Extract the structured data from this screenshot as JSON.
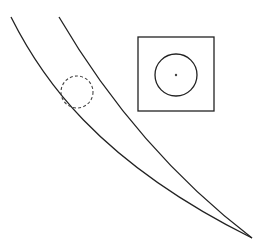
{
  "diagram": {
    "stroke_color": "#222222",
    "background": "#ffffff",
    "band": {
      "left_curve": "M 11 17 C 40 75, 95 160, 252 238",
      "right_curve": "M 59 17 C 90 70, 150 160, 252 238"
    },
    "dashed_circle": {
      "cx": 77,
      "cy": 92,
      "r": 16
    },
    "inset_box": {
      "x": 138,
      "y": 37,
      "width": 76,
      "height": 74
    },
    "inset_circle": {
      "cx": 176,
      "cy": 75,
      "r": 21
    },
    "inset_dot": {
      "cx": 176,
      "cy": 75,
      "r": 1.2
    }
  }
}
